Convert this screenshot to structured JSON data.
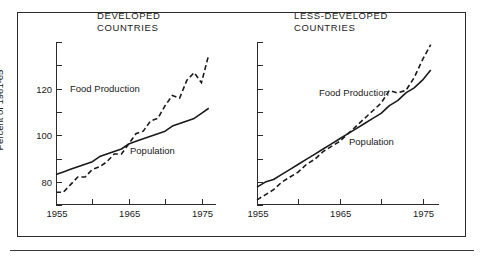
{
  "figure": {
    "background_color": "#ffffff",
    "line_color": "#1a1a1a"
  },
  "axis": {
    "y_title": "Percent of 1961-65",
    "y_ticks_labeled": [
      "80",
      "100",
      "120"
    ],
    "x_ticks_labeled": [
      "1955",
      "1965",
      "1975"
    ]
  },
  "panels": [
    {
      "key": "developed",
      "title": "DEVELOPED\nCOUNTRIES",
      "food_label": "Food Production",
      "population_label": "Population"
    },
    {
      "key": "less_developed",
      "title": "LESS-DEVELOPED\nCOUNTRIES",
      "food_label": "Food Production",
      "population_label": "Population"
    }
  ],
  "chart_data": {
    "type": "line",
    "xlabel": "",
    "ylabel": "Percent of 1961-65",
    "xlim": [
      1955,
      1977
    ],
    "ylim": [
      68,
      132
    ],
    "x_tick_values": [
      1955,
      1960,
      1965,
      1970,
      1975
    ],
    "x_tick_labels": [
      "1955",
      "",
      "1965",
      "",
      "1975"
    ],
    "y_tick_values": [
      70,
      80,
      90,
      100,
      110,
      120,
      130
    ],
    "y_tick_labels": [
      "",
      "80",
      "",
      "100",
      "",
      "120",
      ""
    ],
    "grid": false,
    "legend": "inline-annotations",
    "panels": [
      {
        "name": "DEVELOPED COUNTRIES",
        "x": [
          1955,
          1956,
          1957,
          1958,
          1959,
          1960,
          1961,
          1962,
          1963,
          1964,
          1965,
          1966,
          1967,
          1968,
          1969,
          1970,
          1971,
          1972,
          1973,
          1974,
          1975,
          1976
        ],
        "series": [
          {
            "name": "Food Production",
            "style": "dashed",
            "values": [
              73,
              73,
              76,
              79,
              79,
              82,
              83,
              85,
              88,
              88,
              92,
              96,
              97,
              101,
              102,
              107,
              111,
              110,
              117,
              120,
              116,
              127
            ]
          },
          {
            "name": "Population",
            "style": "solid",
            "values": [
              80,
              81,
              82,
              83,
              84,
              85,
              87,
              88,
              89,
              90,
              92,
              93,
              94,
              95,
              96,
              97,
              99,
              100,
              101,
              102,
              104,
              106
            ]
          }
        ]
      },
      {
        "name": "LESS-DEVELOPED COUNTRIES",
        "x": [
          1955,
          1956,
          1957,
          1958,
          1959,
          1960,
          1961,
          1962,
          1963,
          1964,
          1965,
          1966,
          1967,
          1968,
          1969,
          1970,
          1971,
          1972,
          1973,
          1974,
          1975,
          1976
        ],
        "series": [
          {
            "name": "Food Production",
            "style": "dashed",
            "values": [
              70,
              72,
              74,
              77,
              79,
              81,
              84,
              86,
              89,
              91,
              93,
              96,
              99,
              102,
              105,
              108,
              113,
              112,
              113,
              118,
              125,
              131
            ]
          },
          {
            "name": "Population",
            "style": "solid",
            "values": [
              75,
              77,
              78,
              80,
              82,
              84,
              86,
              88,
              90,
              92,
              94,
              96,
              98,
              100,
              102,
              104,
              107,
              109,
              112,
              114,
              117,
              121
            ]
          }
        ]
      }
    ]
  }
}
